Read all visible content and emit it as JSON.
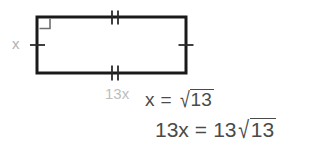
{
  "figure": {
    "type": "rectangle",
    "right_angle_marker": "top-left",
    "colors": {
      "stroke": "#1a1a1a",
      "tick": "#2b2b2b",
      "label_gray": "#b9b9b9",
      "equation_gray": "#4a4a4a",
      "background": "#ffffff"
    },
    "geometry": {
      "left": 37,
      "top": 17,
      "right": 186,
      "bottom": 73,
      "stroke_width": 3
    },
    "tick_marks": {
      "top": {
        "count": 2,
        "label": "double-tick"
      },
      "bottom": {
        "count": 2,
        "label": "double-tick"
      },
      "left": {
        "count": 1,
        "label": "single-tick"
      },
      "right": {
        "count": 1,
        "label": "single-tick"
      }
    }
  },
  "labels": {
    "side_x": "x",
    "base_13x": "13x"
  },
  "equations": [
    {
      "id": "eq1",
      "lhs": "x",
      "operator": "=",
      "rhs_coefficient": "",
      "radical_symbol": "√",
      "radicand": "13",
      "plain": "x = √13"
    },
    {
      "id": "eq2",
      "lhs": "13x",
      "operator": "=",
      "rhs_coefficient": "13",
      "radical_symbol": "√",
      "radicand": "13",
      "plain": "13x = 13√13"
    }
  ]
}
